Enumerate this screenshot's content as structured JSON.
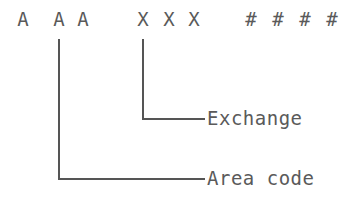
{
  "diagram": {
    "title": "",
    "format": {
      "groups": [
        {
          "name": "area-code-placeholder",
          "chars": [
            "A",
            "A",
            "A"
          ],
          "x": [
            23,
            59,
            83
          ]
        },
        {
          "name": "exchange-placeholder",
          "chars": [
            "X",
            "X",
            "X"
          ],
          "x": [
            143,
            170,
            194
          ]
        },
        {
          "name": "number-placeholder",
          "chars": [
            "#",
            "#",
            "#",
            "#"
          ],
          "x": [
            250,
            277,
            304,
            332
          ]
        }
      ]
    },
    "callouts": [
      {
        "label": "Exchange",
        "target_group": "exchange-placeholder",
        "anchor_x": 143,
        "label_y": 118
      },
      {
        "label": "Area code",
        "target_group": "area-code-placeholder",
        "anchor_x": 59,
        "label_y": 178
      }
    ],
    "colors": {
      "ink": "#5a5a5a",
      "background": "#ffffff"
    }
  }
}
